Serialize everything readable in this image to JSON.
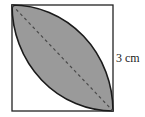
{
  "figure": {
    "side_label": "3 cm",
    "colors": {
      "square_stroke": "#222222",
      "lens_fill": "#9a9a9a",
      "lens_stroke": "#1a1a1a",
      "diagonal": "#4a4a4a",
      "background": "#ffffff"
    }
  }
}
